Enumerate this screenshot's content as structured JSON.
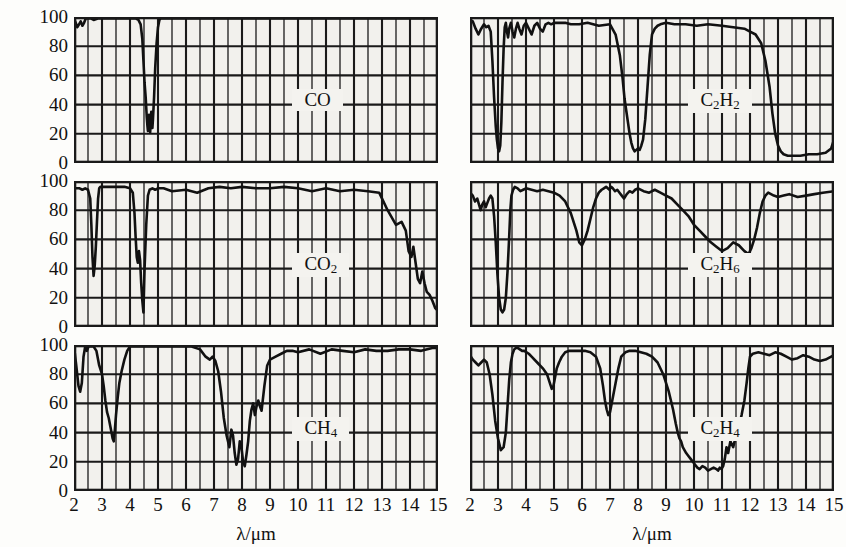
{
  "figure": {
    "axis": {
      "xlabel": "λ/μm",
      "ylabel": "透射率/100",
      "yticks": [
        "100",
        "80",
        "60",
        "40",
        "20",
        "0"
      ],
      "xticks": [
        "2",
        "3",
        "4",
        "5",
        "6",
        "7",
        "8",
        "9",
        "10",
        "11",
        "12",
        "13",
        "14",
        "15"
      ],
      "xlim": [
        2,
        15
      ],
      "ylim": [
        0,
        100
      ],
      "minor_x_step": 0.5,
      "grid": true,
      "gridcolor": "#1a1a1a",
      "plotbg": "#f2f1ed",
      "curvecolor": "#111111"
    },
    "panels": [
      {
        "id": "co",
        "label_html": "CO",
        "label_plain": "CO",
        "col": 0,
        "row": 0
      },
      {
        "id": "co2",
        "label_html": "CO<sub>2</sub>",
        "label_plain": "CO2",
        "col": 0,
        "row": 1
      },
      {
        "id": "ch4",
        "label_html": "CH<sub>4</sub>",
        "label_plain": "CH4",
        "col": 0,
        "row": 2
      },
      {
        "id": "c2h2",
        "label_html": "C<sub>2</sub>H<sub>2</sub>",
        "label_plain": "C2H2",
        "col": 1,
        "row": 0
      },
      {
        "id": "c2h6",
        "label_html": "C<sub>2</sub>H<sub>6</sub>",
        "label_plain": "C2H6",
        "col": 1,
        "row": 1
      },
      {
        "id": "c2h4",
        "label_html": "C<sub>2</sub>H<sub>4</sub>",
        "label_plain": "C2H4",
        "col": 1,
        "row": 2
      }
    ]
  },
  "chart_data": [
    {
      "id": "co",
      "type": "line",
      "title": "CO",
      "xlabel": "λ/μm",
      "ylabel": "透射率/100",
      "xlim": [
        2,
        15
      ],
      "ylim": [
        0,
        100
      ],
      "grid": true,
      "x": [
        2.0,
        2.06,
        2.12,
        2.18,
        2.24,
        2.3,
        2.36,
        2.42,
        2.5,
        2.6,
        2.7,
        2.85,
        3.0,
        3.2,
        3.4,
        3.6,
        3.8,
        4.0,
        4.2,
        4.3,
        4.38,
        4.44,
        4.48,
        4.52,
        4.56,
        4.58,
        4.6,
        4.62,
        4.64,
        4.66,
        4.68,
        4.7,
        4.72,
        4.74,
        4.76,
        4.78,
        4.8,
        4.82,
        4.86,
        4.9,
        4.95,
        5.0,
        5.05,
        5.1,
        5.3,
        5.6,
        6.0,
        6.5,
        7.0,
        7.5,
        8.0,
        8.5,
        9.0,
        9.5,
        10.0,
        10.5,
        11.0,
        11.5,
        12.0,
        12.5,
        13.0,
        13.5,
        14.0,
        14.5,
        15.0
      ],
      "y": [
        99,
        96,
        93,
        95,
        97,
        94,
        96,
        99,
        99,
        99,
        98,
        99,
        99,
        99,
        99,
        99,
        99,
        99,
        99,
        98,
        95,
        85,
        70,
        55,
        45,
        38,
        31,
        26,
        22,
        27,
        33,
        25,
        21,
        28,
        35,
        30,
        24,
        30,
        45,
        65,
        82,
        93,
        98,
        99,
        99,
        99,
        99,
        99,
        99,
        99,
        99,
        99,
        99,
        99,
        99,
        99,
        99,
        99,
        99,
        99,
        99,
        99,
        99,
        99,
        99
      ]
    },
    {
      "id": "co2",
      "type": "line",
      "title": "CO2",
      "xlabel": "λ/μm",
      "ylabel": "透射率/100",
      "xlim": [
        2,
        15
      ],
      "ylim": [
        0,
        100
      ],
      "grid": true,
      "x": [
        2.0,
        2.1,
        2.2,
        2.3,
        2.4,
        2.5,
        2.58,
        2.62,
        2.66,
        2.7,
        2.74,
        2.78,
        2.82,
        2.86,
        2.9,
        2.94,
        3.0,
        3.1,
        3.2,
        3.4,
        3.6,
        3.8,
        4.0,
        4.1,
        4.16,
        4.2,
        4.24,
        4.28,
        4.32,
        4.36,
        4.4,
        4.44,
        4.48,
        4.52,
        4.58,
        4.64,
        4.7,
        4.8,
        4.9,
        5.0,
        5.2,
        5.5,
        6.0,
        6.4,
        6.8,
        7.2,
        7.6,
        8.0,
        8.5,
        9.0,
        9.5,
        10.0,
        10.5,
        11.0,
        11.5,
        12.0,
        12.5,
        12.9,
        13.2,
        13.5,
        13.7,
        13.85,
        13.95,
        14.05,
        14.12,
        14.2,
        14.28,
        14.36,
        14.44,
        14.52,
        14.6,
        14.7,
        14.8,
        14.9,
        15.0
      ],
      "y": [
        95,
        95,
        95,
        94,
        95,
        94,
        88,
        70,
        48,
        35,
        42,
        55,
        72,
        88,
        95,
        96,
        96,
        96,
        96,
        96,
        96,
        96,
        95,
        92,
        78,
        62,
        48,
        44,
        52,
        46,
        30,
        18,
        10,
        40,
        70,
        90,
        94,
        95,
        94,
        95,
        95,
        93,
        94,
        92,
        95,
        96,
        95,
        96,
        95,
        95,
        96,
        95,
        93,
        95,
        93,
        94,
        93,
        92,
        80,
        70,
        72,
        66,
        52,
        48,
        55,
        44,
        33,
        30,
        38,
        30,
        24,
        22,
        18,
        13,
        11
      ]
    },
    {
      "id": "ch4",
      "type": "line",
      "title": "CH4",
      "xlabel": "λ/μm",
      "ylabel": "透射率/100",
      "xlim": [
        2,
        15
      ],
      "ylim": [
        0,
        100
      ],
      "grid": true,
      "x": [
        2.0,
        2.08,
        2.16,
        2.22,
        2.28,
        2.34,
        2.4,
        2.46,
        2.52,
        2.6,
        2.7,
        2.8,
        2.9,
        3.0,
        3.06,
        3.12,
        3.18,
        3.24,
        3.3,
        3.34,
        3.38,
        3.42,
        3.46,
        3.5,
        3.56,
        3.62,
        3.7,
        3.8,
        3.9,
        4.0,
        4.2,
        4.4,
        4.6,
        4.8,
        5.0,
        5.4,
        5.8,
        6.2,
        6.5,
        6.7,
        6.85,
        6.95,
        7.05,
        7.15,
        7.25,
        7.35,
        7.45,
        7.55,
        7.62,
        7.68,
        7.74,
        7.8,
        7.86,
        7.92,
        7.98,
        8.04,
        8.1,
        8.16,
        8.22,
        8.28,
        8.34,
        8.4,
        8.46,
        8.52,
        8.58,
        8.64,
        8.7,
        8.8,
        8.9,
        9.0,
        9.2,
        9.4,
        9.6,
        9.8,
        10.0,
        10.4,
        10.8,
        11.2,
        11.6,
        12.0,
        12.4,
        12.8,
        13.2,
        13.6,
        14.0,
        14.4,
        14.8,
        15.0
      ],
      "y": [
        99,
        86,
        72,
        68,
        74,
        92,
        99,
        96,
        99,
        99,
        99,
        96,
        86,
        80,
        72,
        62,
        54,
        50,
        44,
        40,
        36,
        34,
        42,
        52,
        64,
        74,
        82,
        90,
        96,
        99,
        99,
        99,
        99,
        99,
        99,
        99,
        99,
        99,
        97,
        92,
        90,
        92,
        89,
        82,
        68,
        50,
        38,
        30,
        42,
        38,
        26,
        18,
        22,
        34,
        30,
        20,
        17,
        25,
        34,
        48,
        56,
        60,
        52,
        58,
        62,
        58,
        55,
        72,
        86,
        90,
        92,
        94,
        96,
        96,
        95,
        97,
        94,
        97,
        96,
        95,
        97,
        96,
        96,
        97,
        97,
        96,
        98,
        98
      ]
    },
    {
      "id": "c2h2",
      "type": "line",
      "title": "C2H2",
      "xlabel": "λ/μm",
      "ylabel": "透射率/100",
      "xlim": [
        2,
        15
      ],
      "ylim": [
        0,
        100
      ],
      "grid": true,
      "x": [
        2.0,
        2.1,
        2.2,
        2.3,
        2.4,
        2.5,
        2.58,
        2.66,
        2.74,
        2.8,
        2.86,
        2.92,
        2.96,
        3.0,
        3.04,
        3.08,
        3.12,
        3.16,
        3.2,
        3.24,
        3.28,
        3.32,
        3.36,
        3.4,
        3.46,
        3.52,
        3.58,
        3.64,
        3.7,
        3.76,
        3.84,
        3.92,
        4.0,
        4.1,
        4.2,
        4.3,
        4.4,
        4.5,
        4.6,
        4.7,
        4.8,
        4.9,
        5.0,
        5.2,
        5.4,
        5.6,
        5.9,
        6.2,
        6.6,
        7.0,
        7.2,
        7.35,
        7.45,
        7.52,
        7.58,
        7.64,
        7.7,
        7.76,
        7.82,
        7.88,
        7.94,
        8.0,
        8.06,
        8.12,
        8.18,
        8.26,
        8.34,
        8.42,
        8.5,
        8.6,
        8.7,
        8.8,
        9.0,
        9.3,
        9.7,
        10.1,
        10.5,
        11.0,
        11.4,
        11.8,
        12.0,
        12.2,
        12.4,
        12.55,
        12.7,
        12.8,
        12.9,
        13.0,
        13.1,
        13.2,
        13.35,
        13.5,
        13.8,
        14.1,
        14.4,
        14.7,
        14.9,
        15.0
      ],
      "y": [
        98,
        97,
        92,
        88,
        92,
        95,
        93,
        94,
        90,
        70,
        45,
        25,
        16,
        10,
        8,
        12,
        28,
        55,
        78,
        93,
        96,
        90,
        86,
        92,
        96,
        90,
        86,
        92,
        96,
        92,
        88,
        94,
        96,
        92,
        88,
        94,
        96,
        92,
        90,
        95,
        96,
        95,
        96,
        96,
        96,
        95,
        95,
        96,
        94,
        95,
        88,
        74,
        58,
        44,
        36,
        28,
        20,
        14,
        10,
        8,
        9,
        10,
        9,
        12,
        16,
        30,
        52,
        74,
        88,
        92,
        94,
        95,
        96,
        95,
        95,
        94,
        95,
        94,
        93,
        92,
        90,
        88,
        82,
        70,
        52,
        34,
        20,
        12,
        8,
        6,
        5,
        5,
        5,
        6,
        6,
        7,
        10,
        16
      ]
    },
    {
      "id": "c2h6",
      "type": "line",
      "title": "C2H6",
      "xlabel": "λ/μm",
      "ylabel": "透射率/100",
      "xlim": [
        2,
        15
      ],
      "ylim": [
        0,
        100
      ],
      "grid": true,
      "x": [
        2.0,
        2.1,
        2.18,
        2.26,
        2.32,
        2.38,
        2.44,
        2.5,
        2.56,
        2.62,
        2.68,
        2.74,
        2.8,
        2.86,
        2.92,
        2.98,
        3.04,
        3.1,
        3.16,
        3.22,
        3.28,
        3.34,
        3.4,
        3.44,
        3.48,
        3.54,
        3.6,
        3.7,
        3.8,
        3.9,
        4.0,
        4.2,
        4.4,
        4.6,
        4.8,
        5.0,
        5.2,
        5.4,
        5.6,
        5.8,
        5.9,
        6.0,
        6.1,
        6.2,
        6.3,
        6.4,
        6.5,
        6.6,
        6.7,
        6.78,
        6.86,
        6.92,
        6.98,
        7.04,
        7.1,
        7.18,
        7.26,
        7.34,
        7.42,
        7.5,
        7.6,
        7.7,
        7.8,
        7.9,
        8.0,
        8.2,
        8.4,
        8.6,
        8.8,
        9.0,
        9.2,
        9.4,
        9.6,
        9.8,
        10.0,
        10.2,
        10.4,
        10.6,
        10.8,
        11.0,
        11.2,
        11.4,
        11.6,
        11.8,
        11.95,
        12.05,
        12.15,
        12.25,
        12.35,
        12.45,
        12.55,
        12.65,
        12.75,
        12.85,
        13.0,
        13.2,
        13.4,
        13.7,
        14.0,
        14.3,
        14.6,
        15.0
      ],
      "y": [
        92,
        90,
        86,
        88,
        84,
        80,
        84,
        86,
        82,
        85,
        88,
        90,
        88,
        76,
        58,
        36,
        20,
        12,
        10,
        12,
        20,
        38,
        62,
        80,
        90,
        94,
        96,
        95,
        93,
        94,
        95,
        94,
        93,
        94,
        93,
        92,
        90,
        86,
        78,
        66,
        58,
        56,
        60,
        66,
        74,
        82,
        88,
        92,
        94,
        95,
        96,
        95,
        94,
        96,
        95,
        93,
        94,
        92,
        90,
        88,
        91,
        93,
        92,
        94,
        95,
        93,
        92,
        94,
        92,
        90,
        88,
        84,
        80,
        76,
        70,
        66,
        62,
        58,
        55,
        52,
        54,
        58,
        56,
        52,
        50,
        54,
        60,
        68,
        78,
        86,
        90,
        92,
        91,
        90,
        89,
        90,
        91,
        89,
        90,
        91,
        92,
        93
      ]
    },
    {
      "id": "c2h4",
      "type": "line",
      "title": "C2H4",
      "xlabel": "λ/μm",
      "ylabel": "透射率/100",
      "xlim": [
        2,
        15
      ],
      "ylim": [
        0,
        100
      ],
      "grid": true,
      "x": [
        2.0,
        2.1,
        2.2,
        2.3,
        2.4,
        2.5,
        2.6,
        2.7,
        2.8,
        2.9,
        3.0,
        3.1,
        3.2,
        3.28,
        3.34,
        3.4,
        3.46,
        3.52,
        3.58,
        3.64,
        3.7,
        3.78,
        3.86,
        3.94,
        4.02,
        4.1,
        4.2,
        4.4,
        4.6,
        4.75,
        4.85,
        4.92,
        4.98,
        5.04,
        5.1,
        5.18,
        5.28,
        5.4,
        5.55,
        5.7,
        5.9,
        6.1,
        6.3,
        6.5,
        6.65,
        6.75,
        6.82,
        6.88,
        6.94,
        7.0,
        7.06,
        7.12,
        7.2,
        7.3,
        7.4,
        7.55,
        7.7,
        7.9,
        8.1,
        8.3,
        8.5,
        8.7,
        8.9,
        9.1,
        9.25,
        9.35,
        9.42,
        9.48,
        9.54,
        9.6,
        9.66,
        9.72,
        9.8,
        9.88,
        9.96,
        10.04,
        10.12,
        10.2,
        10.3,
        10.4,
        10.5,
        10.6,
        10.7,
        10.8,
        10.86,
        10.92,
        10.98,
        11.04,
        11.1,
        11.16,
        11.22,
        11.3,
        11.4,
        11.5,
        11.6,
        11.7,
        11.8,
        11.88,
        11.94,
        12.0,
        12.1,
        12.3,
        12.5,
        12.7,
        12.9,
        13.1,
        13.3,
        13.5,
        13.7,
        13.9,
        14.1,
        14.3,
        14.5,
        14.7,
        14.9,
        15.0
      ],
      "y": [
        93,
        90,
        88,
        86,
        88,
        90,
        88,
        80,
        66,
        48,
        36,
        28,
        30,
        40,
        58,
        76,
        88,
        94,
        97,
        98,
        98,
        97,
        96,
        96,
        95,
        94,
        92,
        88,
        84,
        80,
        74,
        70,
        72,
        78,
        84,
        88,
        92,
        95,
        96,
        96,
        96,
        96,
        95,
        92,
        84,
        72,
        62,
        56,
        52,
        54,
        60,
        66,
        74,
        84,
        92,
        95,
        96,
        96,
        95,
        94,
        92,
        88,
        80,
        68,
        56,
        46,
        40,
        36,
        34,
        30,
        28,
        26,
        24,
        22,
        20,
        18,
        16,
        15,
        17,
        16,
        14,
        15,
        16,
        15,
        14,
        16,
        15,
        17,
        22,
        30,
        26,
        34,
        30,
        38,
        44,
        52,
        62,
        74,
        84,
        92,
        94,
        95,
        94,
        93,
        95,
        94,
        92,
        90,
        91,
        93,
        92,
        90,
        89,
        90,
        92,
        93
      ]
    }
  ]
}
